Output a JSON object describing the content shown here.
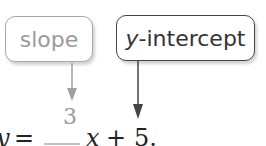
{
  "callouts": {
    "slope": {
      "label": "slope",
      "color": "#9a9a9a"
    },
    "y_intercept": {
      "label_var": "y",
      "label_rest": "-intercept",
      "color": "#333333"
    }
  },
  "equation": {
    "lhs": "y",
    "equals": "=",
    "sign": "−",
    "numerator": "3",
    "variable": "x",
    "plus": "+",
    "constant": "5",
    "end": "."
  }
}
